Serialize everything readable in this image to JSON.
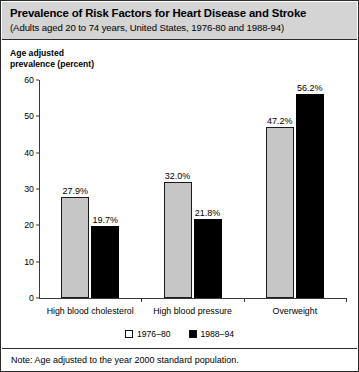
{
  "title": {
    "main": "Prevalence of Risk Factors for Heart Disease and Stroke",
    "subtitle": "(Adults aged 20 to 74 years, United States, 1976-80 and 1988-94)"
  },
  "axis_caption_line1": "Age adjusted",
  "axis_caption_line2": "prevalence (percent)",
  "note": "Note: Age adjusted to the year 2000 standard population.",
  "colors": {
    "series_1976_80": "#c6c6c6",
    "series_1988_94": "#000000",
    "title_band": "#d4d4d4",
    "border": "#2b2b2b"
  },
  "chart_data": {
    "type": "bar",
    "title": "Prevalence of Risk Factors for Heart Disease and Stroke",
    "subtitle": "(Adults aged 20 to 74 years, United States, 1976-80 and 1988-94)",
    "xlabel": "",
    "ylabel": "Age adjusted prevalence (percent)",
    "ylim": [
      0,
      60
    ],
    "yticks": [
      0,
      10,
      20,
      30,
      40,
      50,
      60
    ],
    "ytick_labels": [
      "0",
      "10",
      "20",
      "30",
      "40",
      "50",
      "60"
    ],
    "grid": false,
    "legend_position": "bottom-center",
    "categories": [
      "High blood cholesterol",
      "High blood pressure",
      "Overweight"
    ],
    "series": [
      {
        "name": "1976–80",
        "values": [
          27.9,
          32.0,
          47.2
        ],
        "labels": [
          "27.9%",
          "32.0%",
          "47.2%"
        ]
      },
      {
        "name": "1988–94",
        "values": [
          19.7,
          21.8,
          56.2
        ],
        "labels": [
          "19.7%",
          "21.8%",
          "56.2%"
        ]
      }
    ],
    "note": "Note: Age adjusted to the year 2000 standard population."
  }
}
